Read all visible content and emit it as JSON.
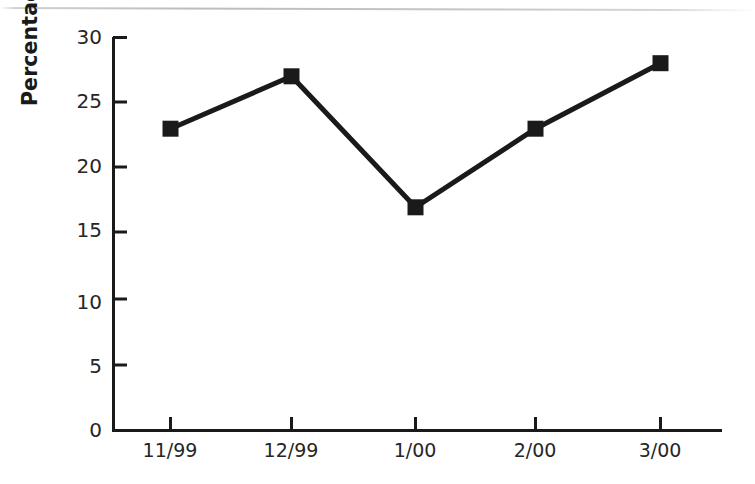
{
  "chart_data": {
    "type": "line",
    "title": "",
    "subtitle": "",
    "xlabel": "",
    "ylabel": "Percentage pf Compliance",
    "categories": [
      "11/99",
      "12/99",
      "1/00",
      "2/00",
      "3/00"
    ],
    "values": [
      23,
      27,
      17,
      23,
      28
    ],
    "series": [
      {
        "name": "Compliance",
        "values": [
          23,
          27,
          17,
          23,
          28
        ],
        "color": "#1a1a1a",
        "marker": "square",
        "line_width_px": 5,
        "marker_size_px": 16
      }
    ],
    "ylim": [
      0,
      30
    ],
    "yticks": [
      0,
      5,
      10,
      15,
      20,
      25,
      30
    ],
    "ytick_labels": [
      "0",
      "5",
      "10",
      "15",
      "20",
      "25",
      "30"
    ],
    "xtick_labels": [
      "11/99",
      "12/99",
      "1/00",
      "2/00",
      "3/00"
    ],
    "grid": false,
    "legend": false,
    "legend_position": "none",
    "axis_color": "#1a1a1a",
    "background_color": "#ffffff",
    "annotations": []
  },
  "axis": {
    "y_title": "Percentage pf Compliance",
    "y_labels": [
      "30",
      "25",
      "20",
      "15",
      "10",
      "5",
      "0"
    ],
    "x_labels": [
      "11/99",
      "12/99",
      "1/00",
      "2/00",
      "3/00"
    ]
  },
  "page": {
    "background_color": "#ffffff",
    "rule_color": "#c2c2c2"
  }
}
